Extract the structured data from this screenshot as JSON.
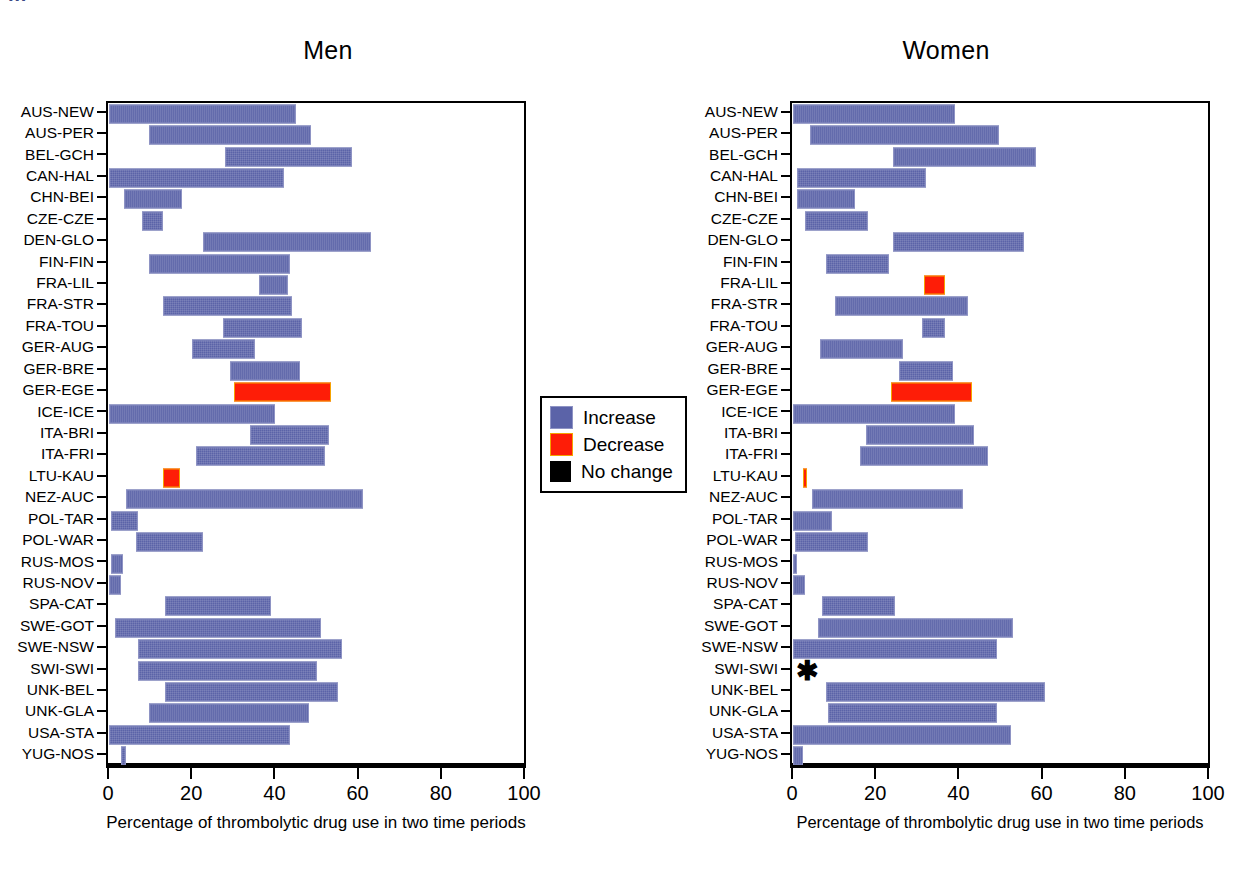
{
  "figure": {
    "cropped_header_text": "…",
    "axis_title": "Percentage of thrombolytic drug use in two time periods",
    "xlim": [
      0,
      100
    ],
    "xticks": [
      0,
      20,
      40,
      60,
      80,
      100
    ],
    "xtick_labels": [
      "0",
      "20",
      "40",
      "60",
      "80",
      "100"
    ],
    "colors": {
      "increase": "#5b63a8",
      "decrease": "#fe1d07",
      "no_change": "#000000",
      "axis": "#000000"
    }
  },
  "legend": {
    "position": "center",
    "items": [
      {
        "key": "increase",
        "label": "Increase",
        "color": "#5b63a8"
      },
      {
        "key": "decrease",
        "label": "Decrease",
        "color": "#fe1d07"
      },
      {
        "key": "no_change",
        "label": "No change",
        "color": "#000000"
      }
    ]
  },
  "panels": [
    {
      "id": "men",
      "title": "Men",
      "axis_title": "Percentage of thrombolytic drug use in two time periods"
    },
    {
      "id": "women",
      "title": "Women",
      "axis_title": "Percentage of thrombolytic drug use in two time periods"
    }
  ],
  "chart_data": {
    "type": "bar",
    "title": "Percentage of thrombolytic drug use in two time periods",
    "subtype": "horizontal range (floating) bars",
    "xlabel": "Percentage of thrombolytic drug use in two time periods",
    "ylabel": "",
    "xlim": [
      0,
      100
    ],
    "xticks": [
      0,
      20,
      40,
      60,
      80,
      100
    ],
    "grid": false,
    "legend_position": "center between panels",
    "legend_entries": [
      "Increase",
      "Decrease",
      "No change"
    ],
    "categories": [
      "AUS-NEW",
      "AUS-PER",
      "BEL-GCH",
      "CAN-HAL",
      "CHN-BEI",
      "CZE-CZE",
      "DEN-GLO",
      "FIN-FIN",
      "FRA-LIL",
      "FRA-STR",
      "FRA-TOU",
      "GER-AUG",
      "GER-BRE",
      "GER-EGE",
      "ICE-ICE",
      "ITA-BRI",
      "ITA-FRI",
      "LTU-KAU",
      "NEZ-AUC",
      "POL-TAR",
      "POL-WAR",
      "RUS-MOS",
      "RUS-NOV",
      "SPA-CAT",
      "SWE-GOT",
      "SWE-NSW",
      "SWI-SWI",
      "UNK-BEL",
      "UNK-GLA",
      "USA-STA",
      "YUG-NOS"
    ],
    "panels": [
      {
        "name": "Men",
        "bars": [
          {
            "category": "AUS-NEW",
            "start": 0,
            "end": 44.5,
            "change": "increase"
          },
          {
            "category": "AUS-PER",
            "start": 9.5,
            "end": 48.0,
            "change": "increase"
          },
          {
            "category": "BEL-GCH",
            "start": 28.0,
            "end": 58.0,
            "change": "increase"
          },
          {
            "category": "CAN-HAL",
            "start": 0,
            "end": 41.5,
            "change": "increase"
          },
          {
            "category": "CHN-BEI",
            "start": 3.5,
            "end": 17.0,
            "change": "increase"
          },
          {
            "category": "CZE-CZE",
            "start": 8.0,
            "end": 12.5,
            "change": "increase"
          },
          {
            "category": "DEN-GLO",
            "start": 22.5,
            "end": 62.5,
            "change": "increase"
          },
          {
            "category": "FIN-FIN",
            "start": 9.5,
            "end": 43.0,
            "change": "increase"
          },
          {
            "category": "FRA-LIL",
            "start": 36.0,
            "end": 42.5,
            "change": "increase"
          },
          {
            "category": "FRA-STR",
            "start": 13.0,
            "end": 43.5,
            "change": "increase"
          },
          {
            "category": "FRA-TOU",
            "start": 27.5,
            "end": 46.0,
            "change": "increase"
          },
          {
            "category": "GER-AUG",
            "start": 20.0,
            "end": 34.5,
            "change": "increase"
          },
          {
            "category": "GER-BRE",
            "start": 29.0,
            "end": 45.5,
            "change": "increase"
          },
          {
            "category": "GER-EGE",
            "start": 30.0,
            "end": 53.0,
            "change": "decrease"
          },
          {
            "category": "ICE-ICE",
            "start": 0,
            "end": 39.5,
            "change": "increase"
          },
          {
            "category": "ITA-BRI",
            "start": 34.0,
            "end": 52.5,
            "change": "increase"
          },
          {
            "category": "ITA-FRI",
            "start": 21.0,
            "end": 51.5,
            "change": "increase"
          },
          {
            "category": "LTU-KAU",
            "start": 13.0,
            "end": 16.5,
            "change": "decrease"
          },
          {
            "category": "NEZ-AUC",
            "start": 4.0,
            "end": 60.5,
            "change": "increase"
          },
          {
            "category": "POL-TAR",
            "start": 0.5,
            "end": 6.5,
            "change": "increase"
          },
          {
            "category": "POL-WAR",
            "start": 6.5,
            "end": 22.0,
            "change": "increase"
          },
          {
            "category": "RUS-MOS",
            "start": 0.5,
            "end": 3.0,
            "change": "increase"
          },
          {
            "category": "RUS-NOV",
            "start": 0,
            "end": 2.5,
            "change": "increase"
          },
          {
            "category": "SPA-CAT",
            "start": 13.5,
            "end": 38.5,
            "change": "increase"
          },
          {
            "category": "SWE-GOT",
            "start": 1.5,
            "end": 50.5,
            "change": "increase"
          },
          {
            "category": "SWE-NSW",
            "start": 7.0,
            "end": 55.5,
            "change": "increase"
          },
          {
            "category": "SWI-SWI",
            "start": 7.0,
            "end": 49.5,
            "change": "increase"
          },
          {
            "category": "UNK-BEL",
            "start": 13.5,
            "end": 54.5,
            "change": "increase"
          },
          {
            "category": "UNK-GLA",
            "start": 9.5,
            "end": 47.5,
            "change": "increase"
          },
          {
            "category": "USA-STA",
            "start": 0,
            "end": 43.0,
            "change": "increase"
          },
          {
            "category": "YUG-NOS",
            "start": 3.0,
            "end": 3.6,
            "change": "increase"
          }
        ]
      },
      {
        "name": "Women",
        "bars": [
          {
            "category": "AUS-NEW",
            "start": 0,
            "end": 38.5,
            "change": "increase"
          },
          {
            "category": "AUS-PER",
            "start": 4.0,
            "end": 49.0,
            "change": "increase"
          },
          {
            "category": "BEL-GCH",
            "start": 24.0,
            "end": 58.0,
            "change": "increase"
          },
          {
            "category": "CAN-HAL",
            "start": 1.0,
            "end": 31.5,
            "change": "increase"
          },
          {
            "category": "CHN-BEI",
            "start": 1.0,
            "end": 14.5,
            "change": "increase"
          },
          {
            "category": "CZE-CZE",
            "start": 3.0,
            "end": 17.5,
            "change": "increase"
          },
          {
            "category": "DEN-GLO",
            "start": 24.0,
            "end": 55.0,
            "change": "increase"
          },
          {
            "category": "FIN-FIN",
            "start": 8.0,
            "end": 22.5,
            "change": "increase"
          },
          {
            "category": "FRA-LIL",
            "start": 31.5,
            "end": 36.0,
            "change": "decrease"
          },
          {
            "category": "FRA-STR",
            "start": 10.0,
            "end": 41.5,
            "change": "increase"
          },
          {
            "category": "FRA-TOU",
            "start": 31.0,
            "end": 36.0,
            "change": "increase"
          },
          {
            "category": "GER-AUG",
            "start": 6.5,
            "end": 26.0,
            "change": "increase"
          },
          {
            "category": "GER-BRE",
            "start": 25.5,
            "end": 38.0,
            "change": "increase"
          },
          {
            "category": "GER-EGE",
            "start": 23.5,
            "end": 42.5,
            "change": "decrease"
          },
          {
            "category": "ICE-ICE",
            "start": 0,
            "end": 38.5,
            "change": "increase"
          },
          {
            "category": "ITA-BRI",
            "start": 17.5,
            "end": 43.0,
            "change": "increase"
          },
          {
            "category": "ITA-FRI",
            "start": 16.0,
            "end": 46.5,
            "change": "increase"
          },
          {
            "category": "LTU-KAU",
            "start": 2.5,
            "end": 3.0,
            "change": "decrease"
          },
          {
            "category": "NEZ-AUC",
            "start": 4.5,
            "end": 40.5,
            "change": "increase"
          },
          {
            "category": "POL-TAR",
            "start": 0,
            "end": 9.0,
            "change": "increase"
          },
          {
            "category": "POL-WAR",
            "start": 0.5,
            "end": 17.5,
            "change": "increase"
          },
          {
            "category": "RUS-MOS",
            "start": 0,
            "end": 0.6,
            "change": "increase"
          },
          {
            "category": "RUS-NOV",
            "start": 0,
            "end": 2.5,
            "change": "increase"
          },
          {
            "category": "SPA-CAT",
            "start": 7.0,
            "end": 24.0,
            "change": "increase"
          },
          {
            "category": "SWE-GOT",
            "start": 6.0,
            "end": 52.5,
            "change": "increase"
          },
          {
            "category": "SWE-NSW",
            "start": 0,
            "end": 48.5,
            "change": "increase"
          },
          {
            "category": "SWI-SWI",
            "start": 0,
            "end": 0,
            "change": "no_change"
          },
          {
            "category": "UNK-BEL",
            "start": 8.0,
            "end": 60.0,
            "change": "increase"
          },
          {
            "category": "UNK-GLA",
            "start": 8.5,
            "end": 48.5,
            "change": "increase"
          },
          {
            "category": "USA-STA",
            "start": 0,
            "end": 52.0,
            "change": "increase"
          },
          {
            "category": "YUG-NOS",
            "start": 0,
            "end": 2.0,
            "change": "increase"
          }
        ]
      }
    ]
  }
}
